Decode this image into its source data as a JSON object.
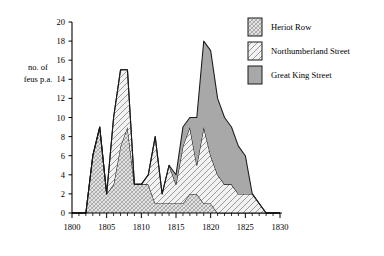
{
  "chart_data": {
    "type": "area",
    "title": "",
    "xlabel": "",
    "ylabel": "no. of feus p.a.",
    "ylabel_line1": "no. of",
    "ylabel_line2": "feus p.a.",
    "xlim": [
      1800,
      1830
    ],
    "ylim": [
      0,
      20
    ],
    "x_ticks_major": [
      1800,
      1805,
      1810,
      1815,
      1820,
      1825,
      1830
    ],
    "x_ticks_major_labels": [
      "1800",
      "1805",
      "1810",
      "1815",
      "1820",
      "1825",
      "1830"
    ],
    "x_ticks_minor_step": 1,
    "y_ticks": [
      0,
      2,
      4,
      6,
      8,
      10,
      12,
      14,
      16,
      18,
      20
    ],
    "y_tick_labels": [
      "0",
      "2",
      "4",
      "6",
      "8",
      "10",
      "12",
      "14",
      "16",
      "18",
      "20"
    ],
    "grid": false,
    "stacked": true,
    "legend_position": "top-right",
    "x": [
      1800,
      1801,
      1802,
      1803,
      1804,
      1805,
      1806,
      1807,
      1808,
      1809,
      1810,
      1811,
      1812,
      1813,
      1814,
      1815,
      1816,
      1817,
      1818,
      1819,
      1820,
      1821,
      1822,
      1823,
      1824,
      1825,
      1826,
      1827,
      1828,
      1829,
      1830
    ],
    "series": [
      {
        "name": "Heriot Row",
        "fill_pattern": "fine-cross-hatch",
        "fill_color": "#d9d9d9",
        "values": [
          0,
          0,
          0,
          6,
          9,
          2,
          3,
          7,
          9,
          3,
          3,
          3,
          1,
          1,
          1,
          1,
          1,
          2,
          2,
          1,
          1,
          0,
          0,
          0,
          0,
          0,
          0,
          0,
          0,
          0,
          0
        ]
      },
      {
        "name": "Northumberland Street",
        "fill_pattern": "wide-diagonal-hatch",
        "fill_color": "#ececec",
        "values": [
          0,
          0,
          0,
          0,
          0,
          0,
          7,
          8,
          6,
          0,
          0,
          1,
          7,
          1,
          4,
          2,
          6,
          7,
          3,
          8,
          5,
          4,
          3,
          3,
          2,
          2,
          2,
          1,
          0,
          0,
          0
        ]
      },
      {
        "name": "Great King Street",
        "fill_pattern": "solid-gray",
        "fill_color": "#a8a8a8",
        "values": [
          0,
          0,
          0,
          0,
          0,
          0,
          0,
          0,
          0,
          0,
          0,
          0,
          0,
          0,
          0,
          1,
          2,
          1,
          5,
          9,
          11,
          8,
          7,
          6,
          5,
          4,
          0,
          0,
          0,
          0,
          0
        ]
      }
    ]
  },
  "legend": {
    "items": [
      {
        "label": "Heriot Row",
        "swatch": "fine-cross-hatch-swatch"
      },
      {
        "label": "Northumberland Street",
        "swatch": "wide-diagonal-hatch-swatch"
      },
      {
        "label": "Great King Street",
        "swatch": "solid-gray-swatch"
      }
    ]
  }
}
